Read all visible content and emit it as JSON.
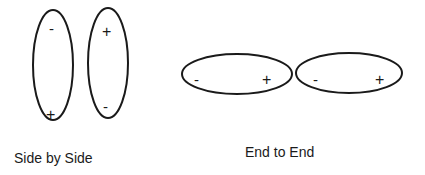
{
  "diagram": {
    "stroke_color": "#1a1a1a",
    "background": "#ffffff",
    "groups": [
      {
        "label": "Side by Side",
        "orientation": "vertical",
        "dipoles": [
          {
            "top_sign": "-",
            "bottom_sign": "+"
          },
          {
            "top_sign": "+",
            "bottom_sign": "-"
          }
        ]
      },
      {
        "label": "End to End",
        "orientation": "horizontal",
        "dipoles": [
          {
            "left_sign": "-",
            "right_sign": "+"
          },
          {
            "left_sign": "-",
            "right_sign": "+"
          }
        ]
      }
    ]
  }
}
